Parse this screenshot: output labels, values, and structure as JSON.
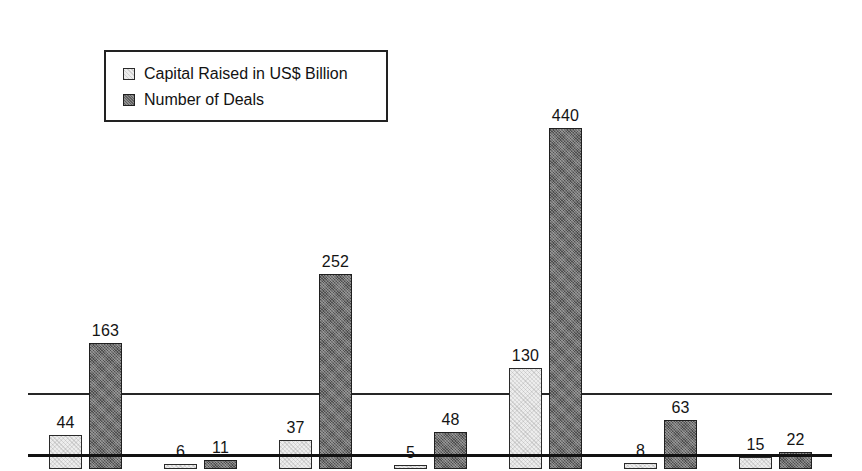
{
  "chart_data": {
    "type": "bar",
    "title": "",
    "subtitle": "",
    "xlabel": "",
    "ylabel": "",
    "grid": false,
    "legend_position": "top-left",
    "ylim": [
      0,
      440
    ],
    "axis_visible": true,
    "categories": [
      "US",
      "Brazil",
      "Europe",
      "Middle East\nand Africa",
      "China",
      "India",
      "Japan"
    ],
    "series": [
      {
        "name": "Capital Raised in US$ Billion",
        "color": "#ededed",
        "values": [
          44,
          6,
          37,
          5,
          130,
          8,
          15
        ]
      },
      {
        "name": "Number of Deals",
        "color": "#6e6e6e",
        "values": [
          163,
          11,
          252,
          48,
          440,
          63,
          22
        ]
      }
    ]
  },
  "legend": {
    "entries": [
      {
        "label": "Capital Raised in US$ Billion",
        "swatch": "light"
      },
      {
        "label": "Number of Deals",
        "swatch": "dark"
      }
    ]
  },
  "layout": {
    "group_width": 115,
    "group_left_positions": [
      28,
      143,
      258,
      373,
      488,
      603,
      718
    ],
    "px_per_unit": 0.775,
    "baseline_y": 393
  }
}
